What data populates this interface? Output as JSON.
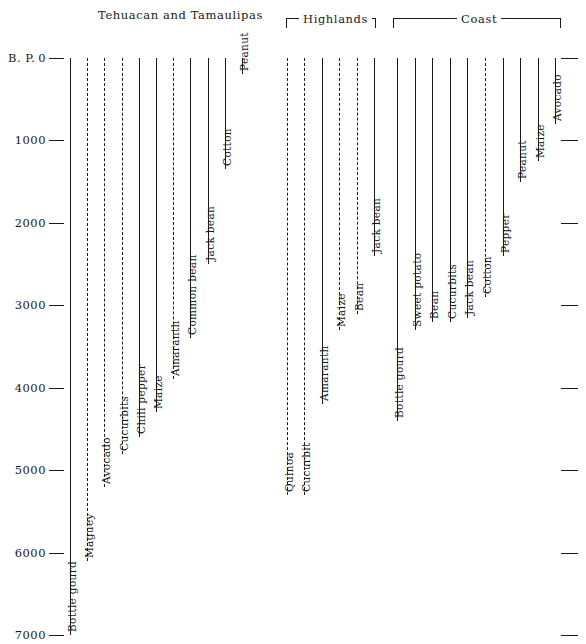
{
  "figure": {
    "axis_label": "B. P.",
    "axis_ticks": [
      "0",
      "1000",
      "2000",
      "3000",
      "4000",
      "5000",
      "6000",
      "7000"
    ],
    "groups": [
      {
        "name": "Tehuacan and Tamaulipas",
        "style": "plain"
      },
      {
        "name": "Highlands",
        "style": "bracket"
      },
      {
        "name": "Coast",
        "style": "bracket"
      }
    ]
  },
  "chart_data": {
    "type": "line",
    "xlabel": "",
    "ylabel": "B. P.",
    "ylim": [
      0,
      7000
    ],
    "y_inverted": true,
    "grid": false,
    "legend": "none",
    "tick_labels": [
      "0",
      "1000",
      "2000",
      "3000",
      "4000",
      "5000",
      "6000",
      "7000"
    ],
    "note": "Each vertical line is a crop's time range in years B.P.; line top = 0 B.P. (present), line bottom = earliest date of the crop. Dashed lines indicate uncertain / inferred ranges.",
    "series": [
      {
        "name": "Bottle gourd",
        "group": "Tehuacan and Tamaulipas",
        "linestyle": "solid",
        "start_bp": 0,
        "end_bp": 7000
      },
      {
        "name": "Maguey",
        "group": "Tehuacan and Tamaulipas",
        "linestyle": "dashed",
        "start_bp": 0,
        "end_bp": 6100
      },
      {
        "name": "Avocado",
        "group": "Tehuacan and Tamaulipas",
        "linestyle": "dashed",
        "start_bp": 0,
        "end_bp": 5200
      },
      {
        "name": "Cucurbits",
        "group": "Tehuacan and Tamaulipas",
        "linestyle": "dashed",
        "start_bp": 0,
        "end_bp": 4800
      },
      {
        "name": "Chili pepper",
        "group": "Tehuacan and Tamaulipas",
        "linestyle": "solid",
        "start_bp": 0,
        "end_bp": 4600
      },
      {
        "name": "Maize",
        "group": "Tehuacan and Tamaulipas",
        "linestyle": "solid",
        "start_bp": 0,
        "end_bp": 4300
      },
      {
        "name": "Amaranth",
        "group": "Tehuacan and Tamaulipas",
        "linestyle": "dashed",
        "start_bp": 0,
        "end_bp": 3900
      },
      {
        "name": "Common bean",
        "group": "Tehuacan and Tamaulipas",
        "linestyle": "solid",
        "start_bp": 0,
        "end_bp": 3400
      },
      {
        "name": "Jack bean",
        "group": "Tehuacan and Tamaulipas",
        "linestyle": "solid",
        "start_bp": 0,
        "end_bp": 2500
      },
      {
        "name": "Cotton",
        "group": "Tehuacan and Tamaulipas",
        "linestyle": "solid",
        "start_bp": 0,
        "end_bp": 1350
      },
      {
        "name": "Peanut",
        "group": "Tehuacan and Tamaulipas",
        "linestyle": "solid",
        "start_bp": 0,
        "end_bp": 200
      },
      {
        "name": "Quinoa",
        "group": "Highlands",
        "linestyle": "dashed",
        "start_bp": 0,
        "end_bp": 5300
      },
      {
        "name": "Cucurbit",
        "group": "Highlands",
        "linestyle": "dashed",
        "start_bp": 0,
        "end_bp": 5300
      },
      {
        "name": "Amaranth",
        "group": "Highlands",
        "linestyle": "solid",
        "start_bp": 0,
        "end_bp": 4200
      },
      {
        "name": "Maize",
        "group": "Highlands",
        "linestyle": "dashed",
        "start_bp": 0,
        "end_bp": 3300
      },
      {
        "name": "Bean",
        "group": "Highlands",
        "linestyle": "dashed",
        "start_bp": 0,
        "end_bp": 3100
      },
      {
        "name": "Jack bean",
        "group": "Highlands",
        "linestyle": "solid",
        "start_bp": 0,
        "end_bp": 2400
      },
      {
        "name": "Bottle gourd",
        "group": "Coast",
        "linestyle": "solid",
        "start_bp": 0,
        "end_bp": 4400
      },
      {
        "name": "Sweet potato",
        "group": "Coast",
        "linestyle": "solid",
        "start_bp": 0,
        "end_bp": 3300
      },
      {
        "name": "Bean",
        "group": "Coast",
        "linestyle": "solid",
        "start_bp": 0,
        "end_bp": 3200
      },
      {
        "name": "Cucurbits",
        "group": "Coast",
        "linestyle": "solid",
        "start_bp": 0,
        "end_bp": 3200
      },
      {
        "name": "Jack bean",
        "group": "Coast",
        "linestyle": "solid",
        "start_bp": 0,
        "end_bp": 3150
      },
      {
        "name": "Cotton",
        "group": "Coast",
        "linestyle": "dashed",
        "start_bp": 0,
        "end_bp": 2900
      },
      {
        "name": "Pepper",
        "group": "Coast",
        "linestyle": "solid",
        "start_bp": 0,
        "end_bp": 2400
      },
      {
        "name": "Peanut",
        "group": "Coast",
        "linestyle": "solid",
        "start_bp": 0,
        "end_bp": 1500
      },
      {
        "name": "Maize",
        "group": "Coast",
        "linestyle": "solid",
        "start_bp": 0,
        "end_bp": 1250
      },
      {
        "name": "Avocado",
        "group": "Coast",
        "linestyle": "solid",
        "start_bp": 0,
        "end_bp": 800
      }
    ]
  },
  "colors": {
    "ink": "#1a1a1a",
    "background": "#ffffff"
  }
}
